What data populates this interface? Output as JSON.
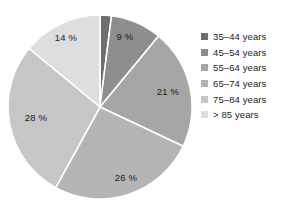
{
  "chart_data": {
    "type": "pie",
    "title": "",
    "subtitle": "",
    "xlabel": "",
    "ylabel": "",
    "grid": false,
    "legend_position": "right",
    "start_angle_deg": 0,
    "direction": "clockwise",
    "categories": [
      "35–44 years",
      "45–54 years",
      "55–64 years",
      "65–74 years",
      "75–84 years",
      "> 85 years"
    ],
    "values": [
      2,
      9,
      21,
      26,
      28,
      14
    ],
    "value_labels": [
      "",
      "9 %",
      "21 %",
      "26 %",
      "28 %",
      "14 %"
    ],
    "colors": [
      "#6f6f6f",
      "#8e8e8e",
      "#a6a6a6",
      "#b4b4b4",
      "#c6c6c6",
      "#dedede"
    ],
    "slice_separator_color": "#ffffff",
    "slices": [
      {
        "label": "35–44 years",
        "value": 2,
        "display": "",
        "color": "#6f6f6f"
      },
      {
        "label": "45–54 years",
        "value": 9,
        "display": "9 %",
        "color": "#8e8e8e"
      },
      {
        "label": "55–64 years",
        "value": 21,
        "display": "21 %",
        "color": "#a6a6a6"
      },
      {
        "label": "65–74 years",
        "value": 26,
        "display": "26 %",
        "color": "#b4b4b4"
      },
      {
        "label": "75–84 years",
        "value": 28,
        "display": "28 %",
        "color": "#c6c6c6"
      },
      {
        "label": "> 85 years",
        "value": 14,
        "display": "14 %",
        "color": "#dedede"
      }
    ]
  },
  "legend": {
    "items": [
      {
        "label": "35–44 years",
        "color": "#6f6f6f"
      },
      {
        "label": "45–54 years",
        "color": "#8e8e8e"
      },
      {
        "label": "55–64 years",
        "color": "#a6a6a6"
      },
      {
        "label": "65–74 years",
        "color": "#b4b4b4"
      },
      {
        "label": "75–84 years",
        "color": "#c6c6c6"
      },
      {
        "label": "> 85 years",
        "color": "#dedede"
      }
    ]
  },
  "labels": {
    "pct_9": "9 %",
    "pct_21": "21 %",
    "pct_26": "26 %",
    "pct_28": "28 %",
    "pct_14": "14 %"
  }
}
